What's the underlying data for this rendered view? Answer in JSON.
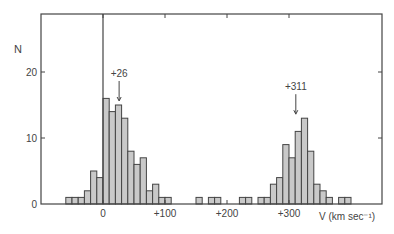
{
  "chart_data": {
    "type": "bar",
    "title": "",
    "xlabel": "V (km sec⁻¹)",
    "ylabel": "N",
    "xlim": [
      -100,
      450
    ],
    "ylim": [
      0,
      30
    ],
    "xticks": [
      {
        "value": 0,
        "label": "0"
      },
      {
        "value": 100,
        "label": "+100"
      },
      {
        "value": 200,
        "label": "+200"
      },
      {
        "value": 300,
        "label": "+300"
      }
    ],
    "yticks": [
      {
        "value": 0,
        "label": "0"
      },
      {
        "value": 10,
        "label": "10"
      },
      {
        "value": 20,
        "label": "20"
      }
    ],
    "bin_width": 10,
    "bins": [
      {
        "start": -60,
        "count": 1
      },
      {
        "start": -50,
        "count": 1
      },
      {
        "start": -40,
        "count": 1
      },
      {
        "start": -30,
        "count": 2
      },
      {
        "start": -20,
        "count": 5
      },
      {
        "start": -10,
        "count": 4
      },
      {
        "start": 0,
        "count": 16
      },
      {
        "start": 10,
        "count": 14
      },
      {
        "start": 20,
        "count": 15
      },
      {
        "start": 30,
        "count": 13
      },
      {
        "start": 40,
        "count": 8
      },
      {
        "start": 50,
        "count": 6
      },
      {
        "start": 60,
        "count": 7
      },
      {
        "start": 70,
        "count": 2
      },
      {
        "start": 80,
        "count": 3
      },
      {
        "start": 90,
        "count": 1
      },
      {
        "start": 100,
        "count": 1
      },
      {
        "start": 150,
        "count": 1
      },
      {
        "start": 170,
        "count": 1
      },
      {
        "start": 180,
        "count": 1
      },
      {
        "start": 220,
        "count": 1
      },
      {
        "start": 230,
        "count": 1
      },
      {
        "start": 250,
        "count": 1
      },
      {
        "start": 260,
        "count": 1
      },
      {
        "start": 270,
        "count": 3
      },
      {
        "start": 280,
        "count": 4
      },
      {
        "start": 290,
        "count": 9
      },
      {
        "start": 300,
        "count": 7
      },
      {
        "start": 310,
        "count": 11
      },
      {
        "start": 320,
        "count": 13
      },
      {
        "start": 330,
        "count": 8
      },
      {
        "start": 340,
        "count": 3
      },
      {
        "start": 350,
        "count": 2
      },
      {
        "start": 360,
        "count": 1
      },
      {
        "start": 380,
        "count": 1
      },
      {
        "start": 390,
        "count": 1
      }
    ],
    "annotations": [
      {
        "text": "+26",
        "x": 26,
        "arrow": true
      },
      {
        "text": "+311",
        "x": 311,
        "arrow": true
      }
    ],
    "vertical_line_at": 0,
    "grid": false,
    "fill": "#c9c9c9"
  }
}
